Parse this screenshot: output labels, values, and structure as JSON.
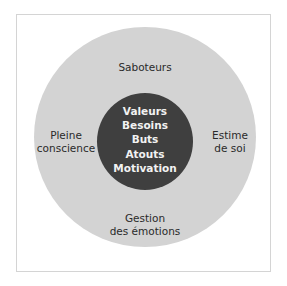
{
  "diagram": {
    "type": "concentric-circles",
    "colors": {
      "frame_border": "#d4d4d4",
      "outer_ring": "#d3d3d3",
      "inner_core": "#3f3f3f",
      "outer_text": "#2a2a2a",
      "inner_text": "#f2f2f2"
    },
    "outer_ring": {
      "top": [
        "Saboteurs"
      ],
      "left": [
        "Pleine",
        "conscience"
      ],
      "right": [
        "Estime",
        "de soi"
      ],
      "bottom": [
        "Gestion",
        "des émotions"
      ]
    },
    "inner_core": {
      "items": [
        "Valeurs",
        "Besoins",
        "Buts",
        "Atouts",
        "Motivation"
      ]
    }
  }
}
